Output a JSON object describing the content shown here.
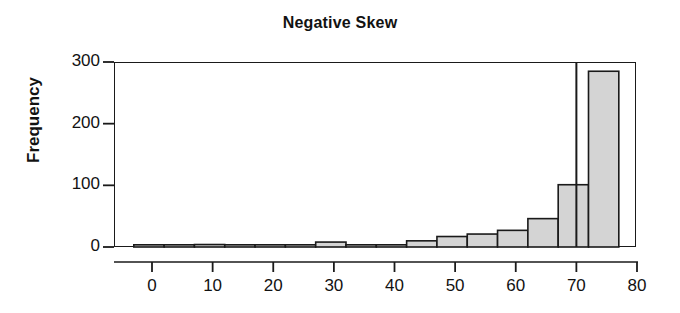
{
  "chart_data": {
    "type": "bar",
    "title": "Negative Skew",
    "subtitle": "",
    "xlabel": "",
    "ylabel": "Frequency",
    "xlim": [
      -5,
      80
    ],
    "ylim": [
      0,
      310
    ],
    "grid": false,
    "legend": null,
    "bin_width": 5,
    "bar_fill": "#d4d4d4",
    "bar_stroke": "#1a1a1a",
    "axis_color": "#1a1a1a",
    "background": "#ffffff",
    "x_ticks": [
      0,
      10,
      20,
      30,
      40,
      50,
      60,
      70,
      80
    ],
    "x_tick_labels": [
      "0",
      "10",
      "20",
      "30",
      "40",
      "50",
      "60",
      "70",
      "80"
    ],
    "y_ticks": [
      0,
      100,
      200,
      300
    ],
    "y_tick_labels": [
      "0",
      "100",
      "200",
      "300"
    ],
    "annotations": [
      {
        "name": "reference-line",
        "type": "vline",
        "x": 70,
        "y_from": 0,
        "y_to": 310
      }
    ],
    "bins": [
      {
        "x0": -3,
        "x1": 2,
        "value": 3
      },
      {
        "x0": 2,
        "x1": 7,
        "value": 1
      },
      {
        "x0": 7,
        "x1": 12,
        "value": 4
      },
      {
        "x0": 12,
        "x1": 17,
        "value": 1
      },
      {
        "x0": 17,
        "x1": 22,
        "value": 1
      },
      {
        "x0": 22,
        "x1": 27,
        "value": 3
      },
      {
        "x0": 27,
        "x1": 32,
        "value": 8
      },
      {
        "x0": 32,
        "x1": 37,
        "value": 2
      },
      {
        "x0": 37,
        "x1": 42,
        "value": 2
      },
      {
        "x0": 42,
        "x1": 47,
        "value": 10
      },
      {
        "x0": 47,
        "x1": 52,
        "value": 17
      },
      {
        "x0": 52,
        "x1": 57,
        "value": 21
      },
      {
        "x0": 57,
        "x1": 62,
        "value": 27
      },
      {
        "x0": 62,
        "x1": 67,
        "value": 46
      },
      {
        "x0": 67,
        "x1": 72,
        "value": 101
      },
      {
        "x0": 72,
        "x1": 77,
        "value": 285
      }
    ],
    "categories": [
      "-3 to 2",
      "2 to 7",
      "7 to 12",
      "12 to 17",
      "17 to 22",
      "22 to 27",
      "27 to 32",
      "32 to 37",
      "37 to 42",
      "42 to 47",
      "47 to 52",
      "52 to 57",
      "57 to 62",
      "62 to 67",
      "67 to 72",
      "72 to 77"
    ],
    "values": [
      3,
      1,
      4,
      1,
      1,
      3,
      8,
      2,
      2,
      10,
      17,
      21,
      27,
      46,
      101,
      285
    ]
  }
}
